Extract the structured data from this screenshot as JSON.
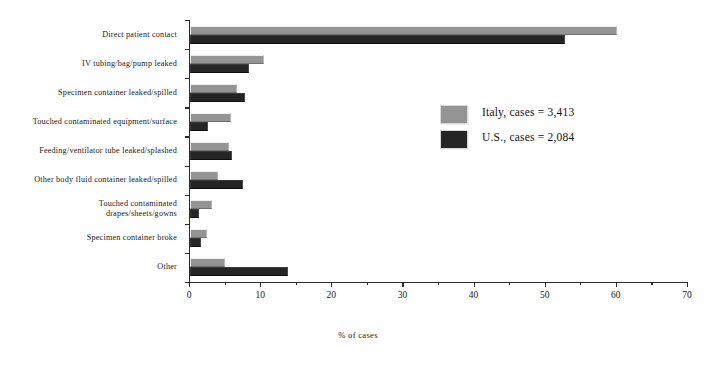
{
  "chart_data": {
    "type": "bar",
    "orientation": "horizontal",
    "title": "",
    "xlabel": "% of cases",
    "ylabel": "",
    "xlim": [
      0,
      70
    ],
    "xticks": [
      0,
      10,
      20,
      30,
      40,
      50,
      60,
      70
    ],
    "xtick_labels": [
      "0",
      "10",
      "20",
      "30",
      "40",
      "50",
      "60",
      "70"
    ],
    "minor_tick_interval": 5,
    "grid": false,
    "legend_position": "center-right",
    "categories": [
      "Direct patient contact",
      "IV tubing/bag/pump leaked",
      "Specimen container leaked/spilled",
      "Touched contaminated equipment/surface",
      "Feeding/ventilator tube leaked/splashed",
      "Other body fluid container leaked/spilled",
      "Touched contaminated\ndrapes/sheets/gowns",
      "Specimen container broke",
      "Other"
    ],
    "series": [
      {
        "name": "Italy, cases = 3,413",
        "color": "#949494",
        "values": [
          60.0,
          10.4,
          6.6,
          5.8,
          5.5,
          3.9,
          3.1,
          2.4,
          4.9
        ]
      },
      {
        "name": "U.S., cases = 2,084",
        "color": "#252525",
        "values": [
          52.7,
          8.3,
          7.7,
          2.5,
          5.9,
          7.4,
          1.3,
          1.6,
          13.8
        ]
      }
    ]
  },
  "legend": {
    "items": [
      {
        "label": "Italy, cases = 3,413",
        "color": "#949494"
      },
      {
        "label": "U.S., cases = 2,084",
        "color": "#252525"
      }
    ]
  },
  "axis": {
    "x_title": "% of cases"
  }
}
